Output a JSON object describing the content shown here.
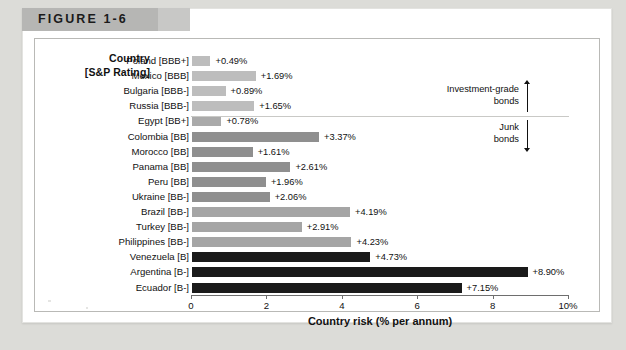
{
  "figure": {
    "label": "FIGURE 1-6"
  },
  "axis_titles": {
    "left_line1": "Country",
    "left_line2": "[S&P Rating]",
    "bottom": "Country risk (% per annum)"
  },
  "annotations": [
    {
      "name": "investment-grade-bracket",
      "line1": "Investment-grade",
      "line2": "bonds",
      "direction": "up"
    },
    {
      "name": "junk-bracket",
      "line1": "Junk",
      "line2": "bonds",
      "direction": "down"
    }
  ],
  "chart_data": {
    "type": "bar",
    "orientation": "horizontal",
    "title": "FIGURE 1-6",
    "xlabel": "Country risk (% per annum)",
    "ylabel": "Country [S&P Rating]",
    "xlim": [
      0,
      10
    ],
    "xticks": [
      0,
      2,
      4,
      6,
      8,
      10
    ],
    "xtick_labels": [
      "0",
      "2",
      "4",
      "6",
      "8",
      "10%"
    ],
    "grid": false,
    "legend": "none",
    "categories": [
      "Poland [BBB+]",
      "Mexico [BBB]",
      "Bulgaria [BBB-]",
      "Russia [BBB-]",
      "Egypt [BB+]",
      "Colombia [BB]",
      "Morocco [BB]",
      "Panama [BB]",
      "Peru [BB]",
      "Ukraine [BB-]",
      "Brazil [BB-]",
      "Turkey [BB-]",
      "Philippines [BB-]",
      "Venezuela [B]",
      "Argentina [B-]",
      "Ecuador [B-]"
    ],
    "values": [
      0.49,
      1.69,
      0.89,
      1.65,
      0.78,
      3.37,
      1.61,
      2.61,
      1.96,
      2.06,
      4.19,
      2.91,
      4.23,
      4.73,
      8.9,
      7.15
    ],
    "data_labels": [
      "+0.49%",
      "+1.69%",
      "+0.89%",
      "+1.65%",
      "+0.78%",
      "+3.37%",
      "+1.61%",
      "+2.61%",
      "+1.96%",
      "+2.06%",
      "+4.19%",
      "+2.91%",
      "+4.23%",
      "+4.73%",
      "+8.90%",
      "+7.15%"
    ],
    "bar_colors": [
      "#bdbdbd",
      "#bdbdbd",
      "#bdbdbd",
      "#bdbdbd",
      "#aaaaaa",
      "#8f8f8f",
      "#8f8f8f",
      "#8f8f8f",
      "#8f8f8f",
      "#8f8f8f",
      "#a5a5a5",
      "#a5a5a5",
      "#a5a5a5",
      "#1a1a1a",
      "#1a1a1a",
      "#1a1a1a"
    ],
    "groups": [
      {
        "name": "Investment-grade bonds",
        "categories": [
          "Poland [BBB+]",
          "Mexico [BBB]",
          "Bulgaria [BBB-]",
          "Russia [BBB-]"
        ]
      },
      {
        "name": "Junk bonds",
        "categories": [
          "Egypt [BB+]",
          "Colombia [BB]",
          "Morocco [BB]",
          "Panama [BB]",
          "Peru [BB]",
          "Ukraine [BB-]",
          "Brazil [BB-]",
          "Turkey [BB-]",
          "Philippines [BB-]",
          "Venezuela [B]",
          "Argentina [B-]",
          "Ecuador [B-]"
        ]
      }
    ]
  },
  "colors": {
    "investment_grade_bar": "#bdbdbd",
    "junk_bb_bar": "#8f8f8f",
    "junk_b_bar": "#1a1a1a",
    "axis": "#6e6e6e",
    "header_band": "#b6b6b4"
  }
}
